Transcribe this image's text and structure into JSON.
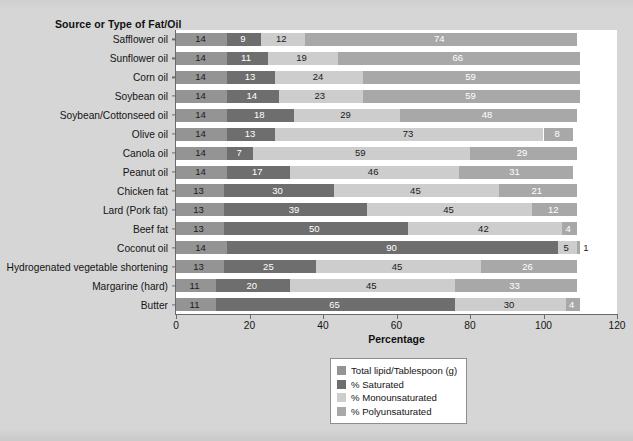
{
  "chart_data": {
    "type": "bar",
    "orientation": "horizontal",
    "stacked": true,
    "title": "",
    "ylabel": "Source or Type of Fat/Oil",
    "xlabel": "Percentage",
    "xlim": [
      0,
      120
    ],
    "xticks": [
      0,
      20,
      40,
      60,
      80,
      100,
      120
    ],
    "grid": false,
    "legend_position": "bottom-right",
    "categories": [
      "Safflower oil",
      "Sunflower oil",
      "Corn oil",
      "Soybean oil",
      "Soybean/Cottonseed oil",
      "Olive oil",
      "Canola oil",
      "Peanut oil",
      "Chicken fat",
      "Lard (Pork fat)",
      "Beef fat",
      "Coconut oil",
      "Hydrogenated vegetable shortening",
      "Margarine (hard)",
      "Butter"
    ],
    "series": [
      {
        "name": "Total lipid/Tablespoon (g)",
        "color": "#949494",
        "values": [
          14,
          14,
          14,
          14,
          14,
          14,
          14,
          14,
          13,
          13,
          13,
          14,
          13,
          11,
          11
        ]
      },
      {
        "name": "% Saturated",
        "color": "#6e6e6e",
        "values": [
          9,
          11,
          13,
          14,
          18,
          13,
          7,
          17,
          30,
          39,
          50,
          90,
          25,
          20,
          65
        ]
      },
      {
        "name": "% Monounsaturated",
        "color": "#cdcdcd",
        "values": [
          12,
          19,
          24,
          23,
          29,
          73,
          59,
          46,
          45,
          45,
          42,
          5,
          45,
          45,
          30
        ]
      },
      {
        "name": "% Polyunsaturated",
        "color": "#a8a8a8",
        "values": [
          74,
          66,
          59,
          59,
          48,
          8,
          29,
          31,
          21,
          12,
          4,
          1,
          26,
          33,
          4
        ]
      }
    ]
  },
  "legend": {
    "entries": [
      {
        "label": "Total lipid/Tablespoon (g)",
        "color": "#949494"
      },
      {
        "label": "% Saturated",
        "color": "#6e6e6e"
      },
      {
        "label": "% Monounsaturated",
        "color": "#cdcdcd"
      },
      {
        "label": "% Polyunsaturated",
        "color": "#a8a8a8"
      }
    ]
  },
  "colors": {
    "page_background": "#d4d4d4",
    "plot_background": "#ffffff",
    "axis": "#6a6a6a",
    "text": "#141414"
  }
}
